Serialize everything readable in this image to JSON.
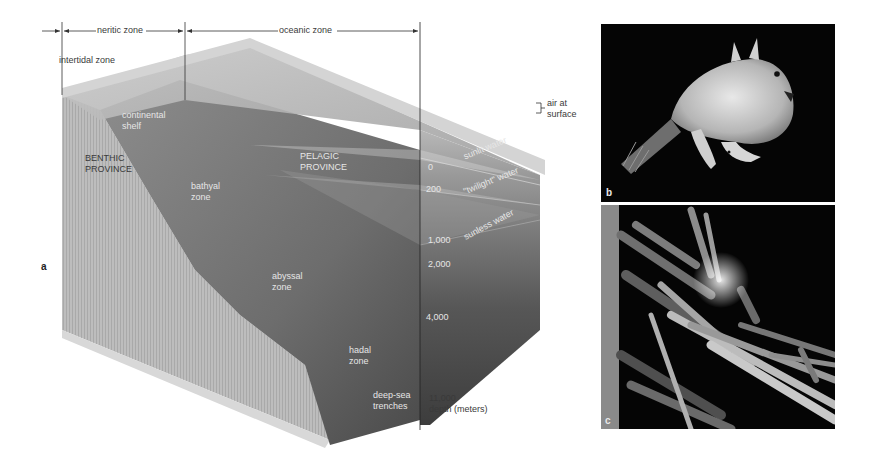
{
  "figure": {
    "panel_a": {
      "letter": "a",
      "top_zones": {
        "neritic": "neritic zone",
        "oceanic": "oceanic zone",
        "intertidal": "intertidal zone"
      },
      "side_labels": {
        "air": [
          "air at",
          "surface"
        ],
        "sunlit": "sunlit water",
        "twilight": "\"twilight\" water",
        "sunless": "sunless water"
      },
      "provinces": {
        "benthic": [
          "BENTHIC",
          "PROVINCE"
        ],
        "pelagic": [
          "PELAGIC",
          "PROVINCE"
        ]
      },
      "seafloor_zones": {
        "shelf": [
          "continental",
          "shelf"
        ],
        "bathyal": [
          "bathyal",
          "zone"
        ],
        "abyssal": [
          "abyssal",
          "zone"
        ],
        "hadal": [
          "hadal",
          "zone"
        ],
        "trenches": [
          "deep-sea",
          "trenches"
        ]
      },
      "depth_scale": {
        "ticks": [
          "0",
          "200",
          "1,000",
          "2,000",
          "4,000",
          "11,000"
        ],
        "unit_label": "depth (meters)"
      }
    },
    "panel_b": {
      "letter": "b",
      "subject": "anglerfish-photo"
    },
    "panel_c": {
      "letter": "c",
      "subject": "tube-worms-photo"
    }
  }
}
